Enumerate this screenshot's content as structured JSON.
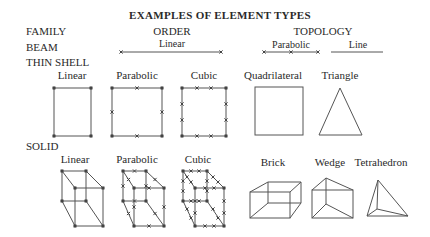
{
  "title": "EXAMPLES OF ELEMENT TYPES",
  "headers": {
    "family": "FAMILY",
    "order": "ORDER",
    "topology": "TOPOLOGY"
  },
  "families": {
    "beam": "BEAM",
    "thin_shell": "THIN SHELL",
    "solid": "SOLID"
  },
  "beam": {
    "order": {
      "linear": "Linear"
    },
    "topology": {
      "parabolic": "Parabolic",
      "line": "Line"
    }
  },
  "thin_shell": {
    "order": [
      "Linear",
      "Parabolic",
      "Cubic"
    ],
    "topology": [
      "Quadrilateral",
      "Triangle"
    ]
  },
  "solid": {
    "order": [
      "Linear",
      "Parabolic",
      "Cubic"
    ],
    "topology": [
      "Brick",
      "Wedge",
      "Tetrahedron"
    ]
  },
  "colors": {
    "line": "#555555",
    "text": "#2a2a2a",
    "background": "#ffffff"
  }
}
